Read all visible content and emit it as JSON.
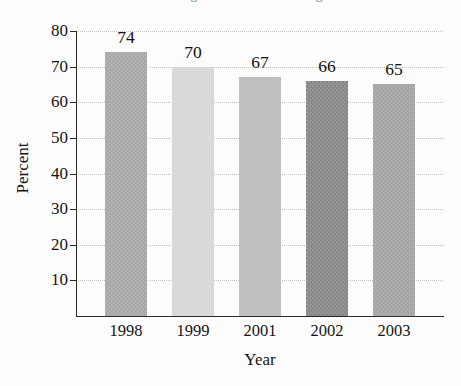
{
  "figure": {
    "title_clipped": "Percentage of Students Passing",
    "background_color": "#fdfdfd",
    "axis_color": "#2c2c2c",
    "gridline_color": "#c2c2c2"
  },
  "chart_data": {
    "type": "bar",
    "title": "Percentage of Students Passing",
    "xlabel": "Year",
    "ylabel": "Percent",
    "categories": [
      "1998",
      "1999",
      "2001",
      "2002",
      "2003"
    ],
    "values": [
      74,
      70,
      67,
      66,
      65
    ],
    "value_labels": [
      "74",
      "70",
      "67",
      "66",
      "65"
    ],
    "bar_colors": [
      "#a8a8a8",
      "#d8d8d8",
      "#bcbcbc",
      "#888888",
      "#a4a4a4"
    ],
    "ylim": [
      0,
      80
    ],
    "ytick_labels": [
      "10",
      "20",
      "30",
      "40",
      "50",
      "60",
      "70",
      "80"
    ],
    "ytick_values": [
      10,
      20,
      30,
      40,
      50,
      60,
      70,
      80
    ],
    "grid": true,
    "grid_style": "dotted-horizontal",
    "legend": null,
    "legend_position": "none"
  }
}
